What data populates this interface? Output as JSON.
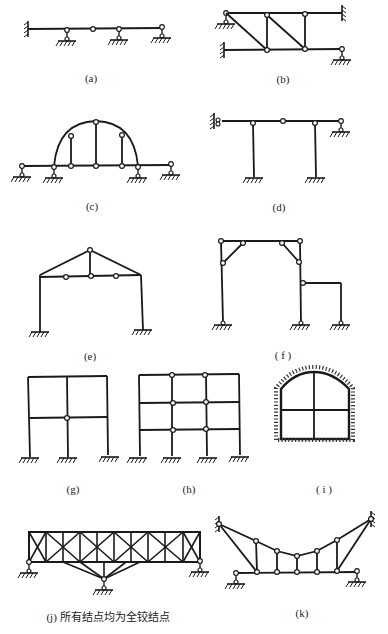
{
  "figure": {
    "stroke_color": "#1a1a1a",
    "background": "#ffffff",
    "panels": [
      {
        "id": "a",
        "label": "(a)",
        "description": "continuous beam: fixed left end, hinge mid-span, three roller/pin supports"
      },
      {
        "id": "b",
        "label": "(b)",
        "description": "two horizontal beams connected by verticals and diagonals; fixed ends and pin supports"
      },
      {
        "id": "c",
        "label": "(c)",
        "description": "arch with tie beam, hinged posts, pin/roller supports"
      },
      {
        "id": "d",
        "label": "(d)",
        "description": "frame with beam on two columns, sliding left support, right roller, hinge at mid beam"
      },
      {
        "id": "e",
        "label": "(e)",
        "description": "portal frame with triangular truss roof and hinges on tie"
      },
      {
        "id": "f",
        "label": "( f )",
        "description": "portal frame with knee braces and attached side frame"
      },
      {
        "id": "g",
        "label": "(g)",
        "description": "two-bay two-storey frame with one internal hinge"
      },
      {
        "id": "h",
        "label": "(h)",
        "description": "three-bay three-storey frame with hinges"
      },
      {
        "id": "i",
        "label": "( i )",
        "description": "arched tunnel frame embedded in ground with cross members"
      },
      {
        "id": "j",
        "label": "(j) 所有结点均为全铰结点",
        "description": "X-braced truss with three supports; all joints are pinned"
      },
      {
        "id": "k",
        "label": "(k)",
        "description": "suspended cable-truss with hangers and fixed top anchors"
      }
    ]
  }
}
